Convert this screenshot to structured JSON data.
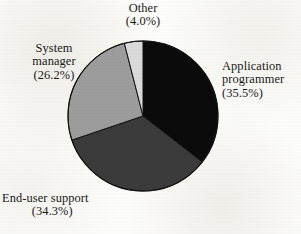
{
  "chart_data": {
    "type": "pie",
    "title": "",
    "subtitle": "",
    "xlabel": "",
    "ylabel": "",
    "legend_position": "outside-labels",
    "grid": false,
    "start_angle_deg": 0,
    "direction": "clockwise",
    "center": {
      "x": 143,
      "y": 116
    },
    "radius": 75,
    "categories": [
      "Application programmer",
      "End-user support",
      "System manager",
      "Other"
    ],
    "values": [
      35.5,
      34.3,
      26.2,
      4.0
    ],
    "value_unit": "%",
    "slice_colors": [
      "#0b0b0b",
      "#3b3b3b",
      "#9c9c9c",
      "#dadada"
    ],
    "slices": [
      {
        "name": "Application programmer",
        "value": 35.5,
        "label_line1": "Application",
        "label_line2": "programmer",
        "label_pct": "(35.5%)",
        "color": "#0b0b0b"
      },
      {
        "name": "End-user support",
        "value": 34.3,
        "label_line1": "End-user support",
        "label_line2": "",
        "label_pct": "(34.3%)",
        "color": "#3b3b3b"
      },
      {
        "name": "System manager",
        "value": 26.2,
        "label_line1": "System",
        "label_line2": "manager",
        "label_pct": "(26.2%)",
        "color": "#9c9c9c"
      },
      {
        "name": "Other",
        "value": 4.0,
        "label_line1": "Other",
        "label_line2": "",
        "label_pct": "(4.0%)",
        "color": "#dadada"
      }
    ],
    "outline_color": "#111111"
  }
}
